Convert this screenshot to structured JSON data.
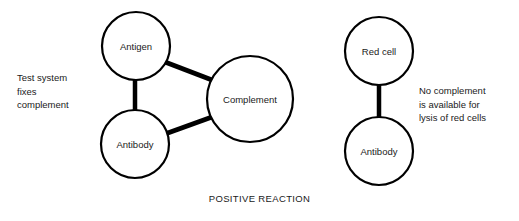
{
  "diagram": {
    "caption": "POSITIVE REACTION",
    "background_color": "#ffffff",
    "stroke_color": "#000000",
    "text_color": "#1a1a1a",
    "groups": [
      {
        "id": "test-system",
        "note": "Test system\nfixes\ncomplement",
        "nodes": [
          {
            "id": "antigen",
            "label": "Antigen",
            "cx": 136,
            "cy": 46,
            "r": 34
          },
          {
            "id": "antibody-left",
            "label": "Antibody",
            "cx": 135,
            "cy": 144,
            "r": 34
          },
          {
            "id": "complement",
            "label": "Complement",
            "cx": 250,
            "cy": 99,
            "r": 43
          }
        ],
        "links": [
          {
            "id": "antigen-antibody",
            "from": "antigen",
            "to": "antibody-left",
            "x1": 135,
            "y1": 79,
            "x2": 135,
            "y2": 112,
            "width": 4.5
          },
          {
            "id": "antigen-complement",
            "from": "antigen",
            "to": "complement",
            "x1": 165,
            "y1": 62,
            "x2": 212,
            "y2": 80,
            "width": 5
          },
          {
            "id": "antibody-complement",
            "from": "antibody-left",
            "to": "complement",
            "x1": 165,
            "y1": 134,
            "x2": 212,
            "y2": 117,
            "width": 5
          }
        ]
      },
      {
        "id": "indicator-system",
        "note": "No complement\nis available for\nlysis of red cells",
        "nodes": [
          {
            "id": "red-cell",
            "label": "Red cell",
            "cx": 379,
            "cy": 51,
            "r": 34
          },
          {
            "id": "antibody-right",
            "label": "Antibody",
            "cx": 379,
            "cy": 151,
            "r": 34
          }
        ],
        "links": [
          {
            "id": "redcell-antibody",
            "from": "red-cell",
            "to": "antibody-right",
            "x1": 379,
            "y1": 84,
            "x2": 379,
            "y2": 118,
            "width": 4.5
          }
        ]
      }
    ]
  }
}
